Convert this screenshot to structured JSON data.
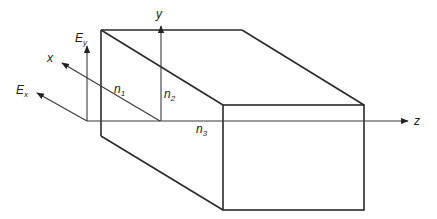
{
  "diagram": {
    "labels": {
      "y_axis": "y",
      "x_axis": "x",
      "z_axis": "z",
      "ey_main": "E",
      "ey_sub": "y",
      "ex_main": "E",
      "ex_sub": "x",
      "n1_main": "n",
      "n1_sub": "1",
      "n2_main": "n",
      "n2_sub": "2",
      "n3_main": "n",
      "n3_sub": "3"
    },
    "colors": {
      "line": "#2a2a2a",
      "background": "#ffffff"
    }
  }
}
